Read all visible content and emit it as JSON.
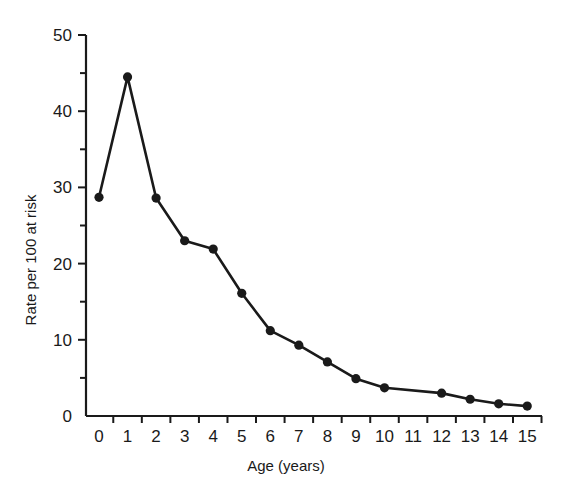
{
  "chart_data": {
    "type": "line",
    "title": "",
    "xlabel": "Age (years)",
    "ylabel": "Rate per 100 at risk",
    "x": [
      0,
      1,
      2,
      3,
      4,
      5,
      6,
      7,
      8,
      9,
      10,
      12,
      13,
      14,
      15
    ],
    "values": [
      28.7,
      44.5,
      28.6,
      23.0,
      21.9,
      16.1,
      11.2,
      9.3,
      7.1,
      4.9,
      3.7,
      3.0,
      2.2,
      1.6,
      1.3
    ],
    "series": [
      {
        "name": "Rate per 100 at risk",
        "x": [
          0,
          1,
          2,
          3,
          4,
          5,
          6,
          7,
          8,
          9,
          10,
          12,
          13,
          14,
          15
        ],
        "values": [
          28.7,
          44.5,
          28.6,
          23.0,
          21.9,
          16.1,
          11.2,
          9.3,
          7.1,
          4.9,
          3.7,
          3.0,
          2.2,
          1.6,
          1.3
        ],
        "marker": "filled-circle",
        "color": "#1a1a1a"
      }
    ],
    "x_tick_labels": [
      "0",
      "1",
      "2",
      "3",
      "4",
      "5",
      "6",
      "7",
      "8",
      "9",
      "10",
      "11",
      "12",
      "13",
      "14",
      "15"
    ],
    "y_tick_labels": [
      "0",
      "10",
      "20",
      "30",
      "40",
      "50"
    ],
    "y_minor_ticks": [
      5,
      15,
      25,
      35,
      45
    ],
    "xlim": [
      0,
      15
    ],
    "ylim": [
      0,
      50
    ],
    "grid": false,
    "legend": null
  }
}
